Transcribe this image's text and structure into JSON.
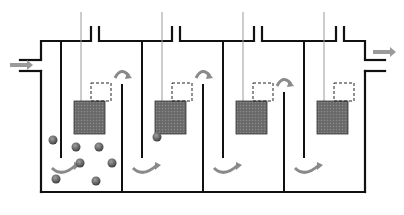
{
  "figure": {
    "panel_label": "(A)",
    "colors": {
      "wall": "#111111",
      "rod": "#999999",
      "block_fill": "#6e6e6e",
      "particle_fill": "#6a6a6a",
      "arrow": "#9a9a9a",
      "dashed_box": "#222222"
    }
  },
  "callouts": {
    "c1": "1",
    "c2": "2",
    "c3": "3",
    "c4": "4",
    "c5": "5",
    "c6": "6",
    "c7": "7",
    "c8": "8"
  },
  "units": [
    {
      "label": "U1"
    },
    {
      "label": "U2"
    },
    {
      "label": "U3"
    },
    {
      "label": "U4"
    }
  ],
  "icons": {
    "inlet": "arrow-right-icon",
    "outlet": "arrow-right-icon",
    "overflow": "curved-arrow-icon",
    "underflow": "curved-arrow-icon"
  }
}
